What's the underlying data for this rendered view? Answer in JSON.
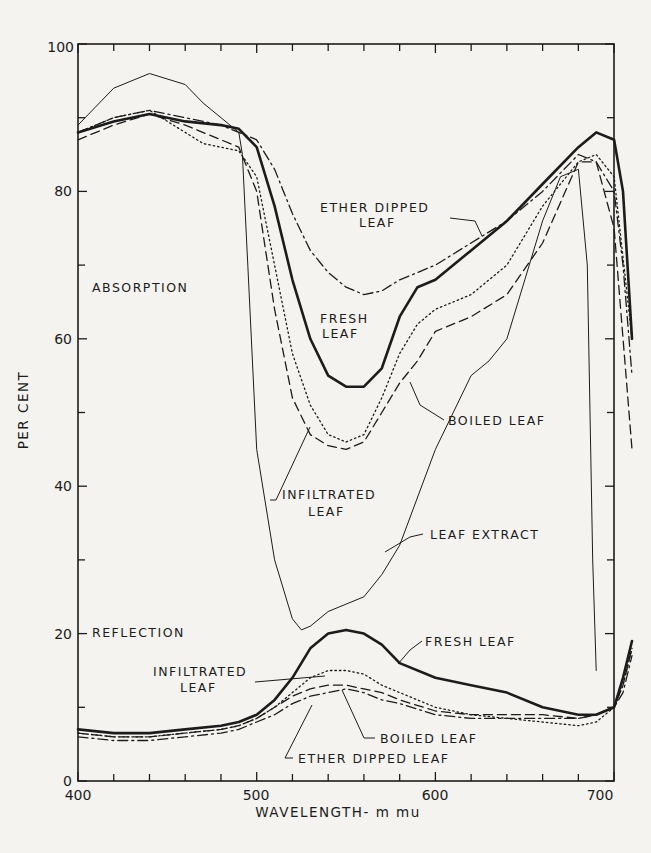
{
  "chart_data": {
    "type": "line",
    "title": "",
    "xlabel": "WAVELENGTH - m mu",
    "ylabel": "PER CENT",
    "xlim": [
      400,
      712
    ],
    "ylim": [
      0,
      100
    ],
    "x_ticks": [
      400,
      500,
      600,
      700
    ],
    "y_ticks": [
      0,
      20,
      40,
      60,
      80,
      100
    ],
    "grid": false,
    "section_labels": [
      "ABSORPTION",
      "REFLECTION"
    ],
    "series": [
      {
        "name": "Absorption - Fresh leaf",
        "style": "thick-solid",
        "x": [
          400,
          420,
          440,
          460,
          480,
          490,
          500,
          510,
          520,
          530,
          540,
          550,
          560,
          570,
          580,
          590,
          600,
          620,
          640,
          660,
          680,
          690,
          700,
          705,
          710
        ],
        "y": [
          88,
          89.5,
          90.5,
          89.5,
          89,
          88.5,
          86,
          78,
          68,
          60,
          55,
          53.5,
          53.5,
          56,
          63,
          67,
          68,
          72,
          76,
          81,
          86,
          88,
          87,
          80,
          60
        ]
      },
      {
        "name": "Absorption - Ether dipped leaf",
        "style": "dash-dot",
        "x": [
          400,
          420,
          440,
          460,
          480,
          490,
          500,
          510,
          520,
          530,
          540,
          550,
          560,
          570,
          580,
          590,
          600,
          620,
          640,
          660,
          680,
          690,
          700,
          705,
          710
        ],
        "y": [
          88,
          90,
          91,
          90,
          89,
          88,
          87,
          83,
          77,
          72,
          69,
          67,
          66,
          66.5,
          68,
          69,
          70,
          73,
          76,
          80,
          85,
          84,
          80,
          70,
          55
        ]
      },
      {
        "name": "Absorption - Boiled leaf",
        "style": "dashed",
        "x": [
          400,
          420,
          440,
          460,
          480,
          490,
          500,
          505,
          510,
          520,
          530,
          540,
          550,
          560,
          570,
          580,
          590,
          600,
          620,
          640,
          660,
          680,
          690,
          700,
          710
        ],
        "y": [
          87,
          89,
          90.5,
          89,
          87,
          86,
          80,
          72,
          64,
          52,
          47,
          45.5,
          45,
          46,
          50,
          54,
          57,
          61,
          63,
          66,
          73,
          84,
          84,
          75,
          45
        ]
      },
      {
        "name": "Absorption - Infiltrated leaf",
        "style": "dotted",
        "x": [
          400,
          420,
          440,
          460,
          470,
          480,
          490,
          500,
          510,
          520,
          530,
          540,
          550,
          560,
          570,
          580,
          590,
          600,
          620,
          640,
          660,
          680,
          690,
          700,
          710
        ],
        "y": [
          88,
          90,
          91,
          88,
          86.5,
          86,
          85.5,
          82,
          70,
          58,
          51,
          47,
          46,
          47,
          52,
          58,
          62,
          64,
          66,
          70,
          78,
          84,
          85,
          82,
          60
        ]
      },
      {
        "name": "Absorption - Leaf extract",
        "style": "thin-solid",
        "x": [
          400,
          420,
          440,
          460,
          470,
          480,
          490,
          492,
          495,
          500,
          510,
          520,
          525,
          530,
          540,
          550,
          560,
          570,
          580,
          600,
          620,
          630,
          640,
          650,
          660,
          670,
          680,
          685,
          688,
          690
        ],
        "y": [
          89,
          94,
          96,
          94.5,
          92,
          90,
          88,
          85,
          70,
          45,
          30,
          22,
          20.5,
          21,
          23,
          24,
          25,
          28,
          32,
          45,
          55,
          57,
          60,
          68,
          76,
          82,
          83,
          70,
          30,
          15
        ]
      },
      {
        "name": "Reflection - Fresh leaf",
        "style": "thick-solid",
        "x": [
          400,
          420,
          440,
          460,
          480,
          490,
          500,
          510,
          520,
          530,
          540,
          550,
          560,
          570,
          580,
          600,
          620,
          640,
          660,
          680,
          690,
          700,
          705,
          710
        ],
        "y": [
          7,
          6.5,
          6.5,
          7,
          7.5,
          8,
          9,
          11,
          14,
          18,
          20,
          20.5,
          20,
          18.5,
          16,
          14,
          13,
          12,
          10,
          9,
          9,
          10,
          14,
          19
        ]
      },
      {
        "name": "Reflection - Infiltrated leaf",
        "style": "dotted",
        "x": [
          400,
          420,
          440,
          460,
          480,
          490,
          500,
          510,
          520,
          530,
          540,
          550,
          560,
          570,
          580,
          600,
          620,
          640,
          660,
          680,
          690,
          700,
          705,
          710
        ],
        "y": [
          6.5,
          6,
          6,
          6.5,
          7,
          7.5,
          8.5,
          10,
          12,
          14,
          15,
          15,
          14.5,
          13,
          12,
          10,
          9,
          8.5,
          8,
          7.5,
          8,
          10,
          13,
          18
        ]
      },
      {
        "name": "Reflection - Boiled leaf",
        "style": "dashed",
        "x": [
          400,
          420,
          440,
          460,
          480,
          490,
          500,
          510,
          520,
          530,
          540,
          550,
          560,
          570,
          580,
          600,
          620,
          640,
          660,
          680,
          690,
          700,
          705,
          710
        ],
        "y": [
          6.5,
          6,
          6,
          6.5,
          7,
          7.5,
          8.5,
          10,
          11.5,
          12.5,
          13,
          13,
          12.5,
          12,
          11,
          9.5,
          9,
          9,
          9,
          8.5,
          9,
          10,
          13,
          18
        ]
      },
      {
        "name": "Reflection - Ether dipped leaf",
        "style": "dash-dot",
        "x": [
          400,
          420,
          440,
          460,
          480,
          490,
          500,
          510,
          520,
          530,
          540,
          550,
          560,
          570,
          580,
          600,
          620,
          640,
          660,
          680,
          690,
          700,
          705,
          710
        ],
        "y": [
          6,
          5.5,
          5.5,
          6,
          6.5,
          7,
          8,
          9,
          10.5,
          11.5,
          12,
          12.5,
          12,
          11,
          10.5,
          9,
          8.5,
          8.5,
          8.5,
          8.5,
          9,
          10,
          12,
          17
        ]
      }
    ],
    "annotations": [
      {
        "text": "ETHER DIPPED",
        "line2": "LEAF",
        "region": "absorption"
      },
      {
        "text": "FRESH",
        "line2": "LEAF",
        "region": "absorption"
      },
      {
        "text": "BOILED LEAF",
        "region": "absorption"
      },
      {
        "text": "INFILTRATED",
        "line2": "LEAF",
        "region": "absorption"
      },
      {
        "text": "LEAF EXTRACT",
        "region": "absorption"
      },
      {
        "text": "FRESH LEAF",
        "region": "reflection"
      },
      {
        "text": "INFILTRATED",
        "line2": "LEAF",
        "region": "reflection"
      },
      {
        "text": "BOILED LEAF",
        "region": "reflection"
      },
      {
        "text": "ETHER DIPPED LEAF",
        "region": "reflection"
      }
    ]
  },
  "labels": {
    "ylabel": "PER CENT",
    "xlabel": "WAVELENGTH- m mu",
    "absorption": "ABSORPTION",
    "reflection": "REFLECTION",
    "ether_dipped_1": "ETHER DIPPED",
    "ether_dipped_2": "LEAF",
    "fresh_1": "FRESH",
    "fresh_2": "LEAF",
    "boiled": "BOILED LEAF",
    "infiltrated_1": "INFILTRATED",
    "infiltrated_2": "LEAF",
    "extract": "LEAF EXTRACT",
    "r_fresh": "FRESH LEAF",
    "r_infiltrated_1": "INFILTRATED",
    "r_infiltrated_2": "LEAF",
    "r_boiled": "BOILED LEAF",
    "r_ether": "ETHER DIPPED LEAF",
    "xt0": "400",
    "xt1": "500",
    "xt2": "600",
    "xt3": "700",
    "yt0": "0",
    "yt1": "20",
    "yt2": "40",
    "yt3": "60",
    "yt4": "80",
    "yt5": "100"
  }
}
